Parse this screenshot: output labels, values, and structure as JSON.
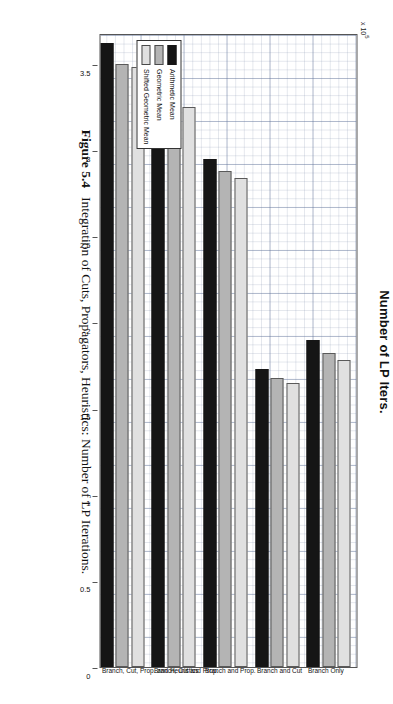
{
  "figure": {
    "caption_number": "Figure 5.4",
    "caption_text": "Integration of Cuts, Propagators, Heuristics: Number of LP Iterations."
  },
  "chart_data": {
    "type": "bar",
    "orientation": "horizontal",
    "title": "Number of LP Iters.",
    "xlabel": "",
    "ylabel": "",
    "axis_multiplier": "x 10",
    "axis_multiplier_exponent": "5",
    "categories": [
      "Branch Only",
      "Branch and Cut",
      "Branch and Prop.",
      "Branch, Cut and Prop.",
      "Branch, Cut, Prop. and Heuristics"
    ],
    "series": [
      {
        "name": "Arithmetic Mean",
        "color": "#151515",
        "values": [
          1.9,
          1.73,
          2.95,
          3.42,
          3.62
        ]
      },
      {
        "name": "Geometric Mean",
        "color": "#b4b4b4",
        "values": [
          1.82,
          1.68,
          2.88,
          3.28,
          3.5
        ]
      },
      {
        "name": "Shifted Geometric Mean",
        "color": "#e0e0e0",
        "values": [
          1.78,
          1.65,
          2.84,
          3.25,
          3.48
        ]
      }
    ],
    "value_axis": {
      "ticks": [
        0,
        0.5,
        1,
        1.5,
        2,
        2.5,
        3,
        3.5
      ],
      "tick_labels": [
        "0",
        "0.5",
        "1",
        "1.5",
        "2",
        "2.5",
        "3",
        "3.5"
      ],
      "min": 0,
      "max": 3.68,
      "grid": true
    },
    "legend": {
      "position": "bottom-left",
      "entries": [
        "Arithmetic Mean",
        "Geometric Mean",
        "Shifted Geometric Mean"
      ]
    }
  }
}
